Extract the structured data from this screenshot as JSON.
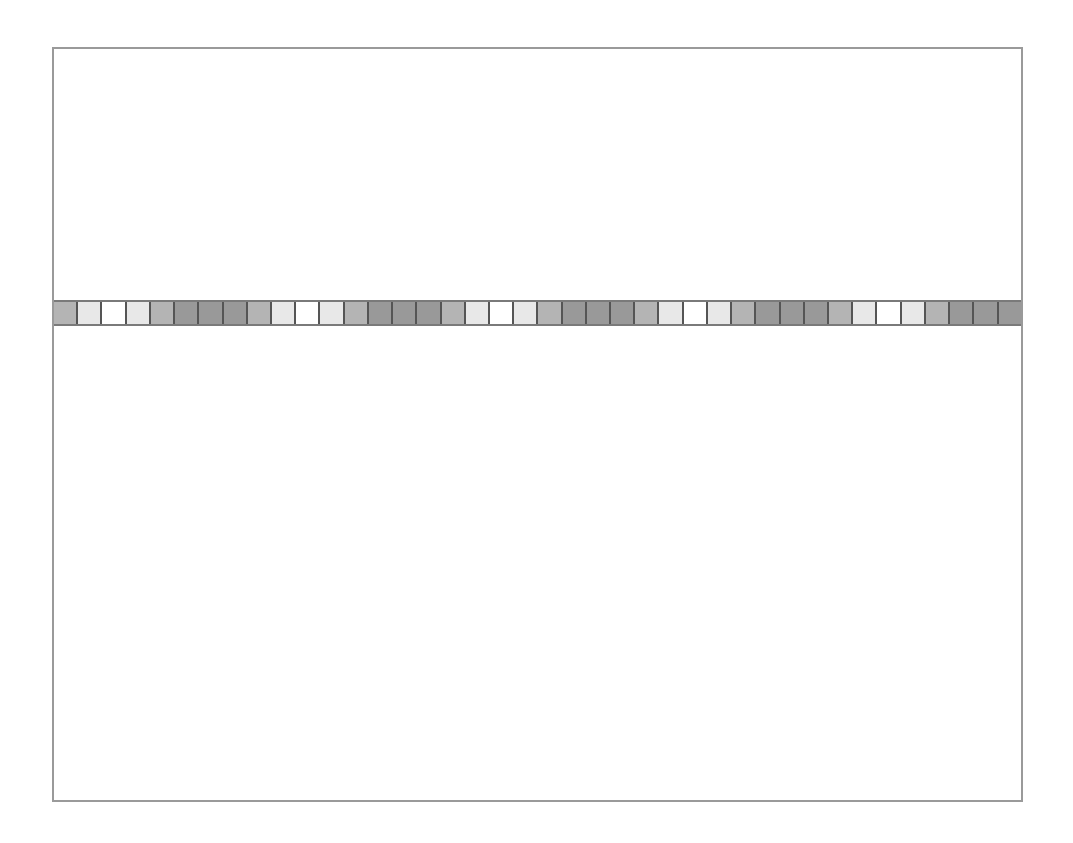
{
  "diagram": {
    "type": "cell-strip",
    "cell_count": 40,
    "pattern_period": 8,
    "pattern": [
      "mid",
      "light",
      "white",
      "light",
      "mid",
      "dark",
      "dark",
      "dark"
    ],
    "shades": {
      "white": "#ffffff",
      "light": "#e8e8e8",
      "mid": "#b4b4b4",
      "dark": "#999999"
    },
    "frame_color": "#9a9a9a",
    "divider_color": "#555555"
  }
}
